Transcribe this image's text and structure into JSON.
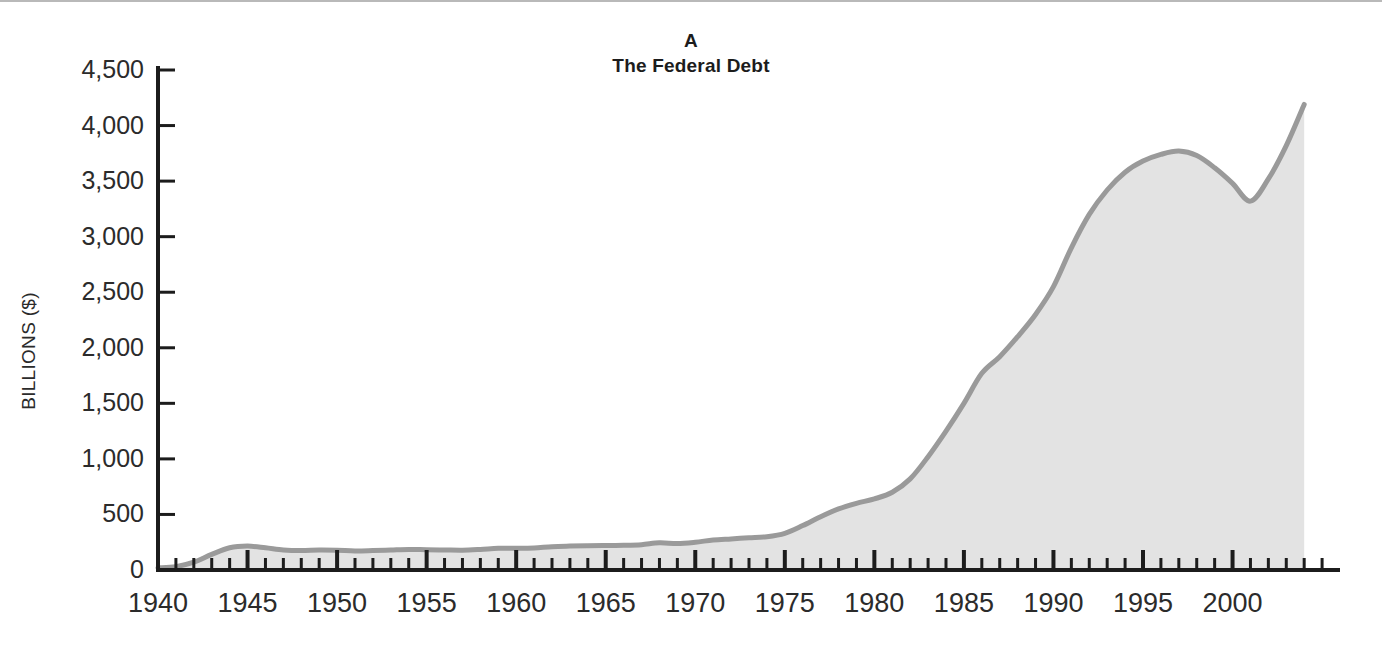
{
  "figure": {
    "panel_letter": "A",
    "title": "The Federal Debt",
    "background_color": "#ffffff"
  },
  "colors": {
    "line": "#9a9a9a",
    "fill": "#e3e3e3",
    "axis": "#1c1c1c",
    "text": "#2b2b2b",
    "title_text": "#1c1c1c",
    "top_rule": "#b9b9b9"
  },
  "chart_data": {
    "type": "area",
    "title": "The Federal Debt",
    "subtitle": "A",
    "xlabel": "",
    "ylabel": "BILLIONS ($)",
    "xlim": [
      1940,
      2006
    ],
    "ylim": [
      0,
      4500
    ],
    "grid": false,
    "legend": null,
    "y_ticks": [
      0,
      500,
      1000,
      1500,
      2000,
      2500,
      3000,
      3500,
      4000,
      4500
    ],
    "y_tick_labels": [
      "0",
      "500",
      "1,000",
      "1,500",
      "2,000",
      "2,500",
      "3,000",
      "3,500",
      "4,000",
      "4,500"
    ],
    "x_ticks_major": [
      1940,
      1945,
      1950,
      1955,
      1960,
      1965,
      1970,
      1975,
      1980,
      1985,
      1990,
      1995,
      2000
    ],
    "x_tick_labels": [
      "1940",
      "1945",
      "1950",
      "1955",
      "1960",
      "1965",
      "1970",
      "1975",
      "1980",
      "1985",
      "1990",
      "1995",
      "2000"
    ],
    "x_minor_tick_step": 1,
    "x_minor_tick_range": [
      1940,
      2005
    ],
    "series": [
      {
        "name": "Federal Debt",
        "units": "billions of dollars",
        "x": [
          1940,
          1941,
          1942,
          1943,
          1944,
          1945,
          1946,
          1947,
          1948,
          1949,
          1950,
          1951,
          1952,
          1953,
          1954,
          1955,
          1956,
          1957,
          1958,
          1959,
          1960,
          1961,
          1962,
          1963,
          1964,
          1965,
          1966,
          1967,
          1968,
          1969,
          1970,
          1971,
          1972,
          1973,
          1974,
          1975,
          1976,
          1977,
          1978,
          1979,
          1980,
          1981,
          1982,
          1983,
          1984,
          1985,
          1986,
          1987,
          1988,
          1989,
          1990,
          1991,
          1992,
          1993,
          1994,
          1995,
          1996,
          1997,
          1998,
          1999,
          2000,
          2001,
          2002,
          2003,
          2004
        ],
        "y": [
          43,
          49,
          72,
          137,
          201,
          260,
          271,
          257,
          252,
          253,
          257,
          255,
          259,
          266,
          271,
          274,
          273,
          271,
          276,
          285,
          287,
          289,
          298,
          306,
          312,
          317,
          320,
          326,
          348,
          354,
          371,
          398,
          427,
          458,
          475,
          533,
          621,
          698,
          772,
          827,
          908,
          998,
          1142,
          1377,
          1572,
          1823,
          2125,
          2350,
          2602,
          2857,
          3233,
          3665,
          4065,
          4411,
          4693,
          4974,
          5225,
          5413,
          5526,
          5656,
          5674,
          5807,
          6228,
          6783,
          7379
        ],
        "y_plotted": [
          20,
          30,
          70,
          140,
          200,
          215,
          200,
          180,
          175,
          180,
          178,
          172,
          175,
          180,
          185,
          182,
          180,
          178,
          185,
          195,
          195,
          198,
          210,
          215,
          218,
          220,
          222,
          228,
          245,
          238,
          250,
          270,
          280,
          290,
          300,
          330,
          400,
          480,
          550,
          600,
          640,
          700,
          820,
          1020,
          1250,
          1500,
          1770,
          1920,
          2100,
          2300,
          2550,
          2900,
          3200,
          3420,
          3580,
          3680,
          3740,
          3770,
          3730,
          3620,
          3480,
          3320,
          3520,
          3820,
          4190
        ],
        "notes": "Values read off the plotted curve in billions of dollars; peak 1997 approx 3,770, local minimum 2001 approx 3,320, end 2004 approx 4,190."
      }
    ]
  },
  "axes": {
    "y_axis_name": "y-axis",
    "x_axis_name": "x-axis"
  }
}
